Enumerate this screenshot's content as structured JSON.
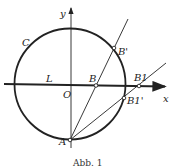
{
  "figure": {
    "caption": "Abb. 1",
    "labels": {
      "y_axis": "y",
      "x_axis": "x",
      "circle": "C",
      "line": "L",
      "origin": "O",
      "point_A": "A",
      "point_B": "B",
      "point_B_prime": "B'",
      "point_B1": "B1",
      "point_B1_prime": "B1'"
    },
    "colors": {
      "stroke": "#222222",
      "background": "#ffffff"
    }
  }
}
